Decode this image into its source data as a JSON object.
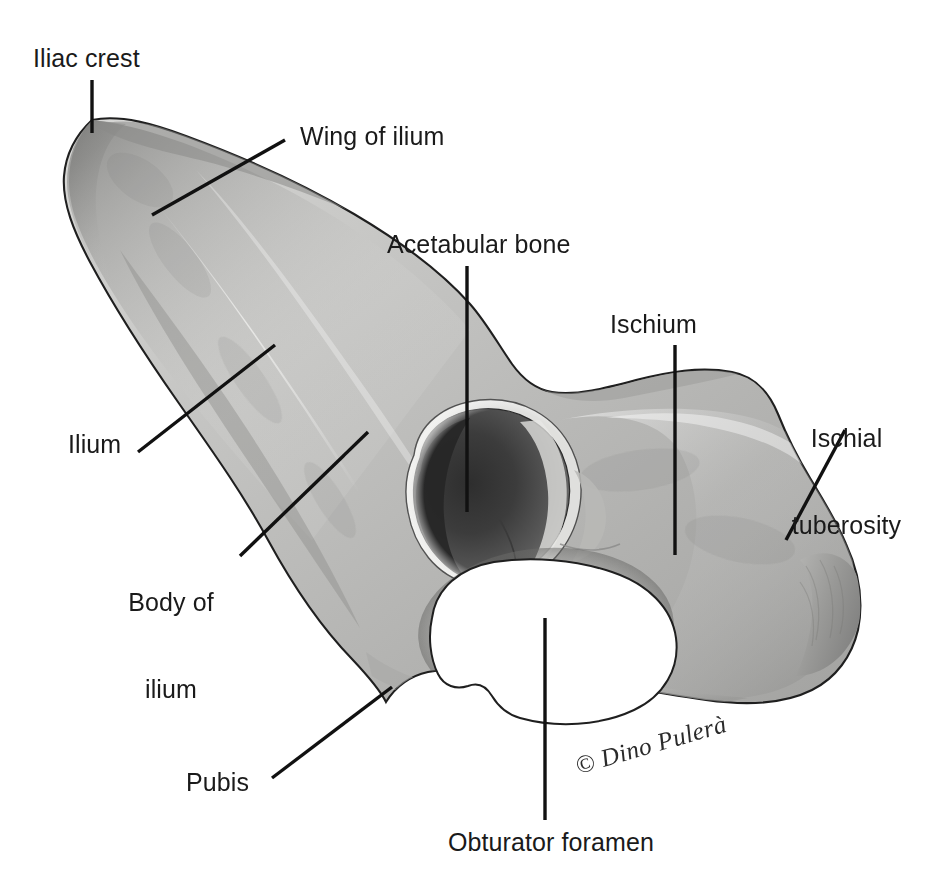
{
  "figure": {
    "background_color": "#ffffff",
    "label_color": "#1a1a1a",
    "leader_line_color": "#111111",
    "width": 939,
    "height": 883
  },
  "labels": {
    "iliac_crest": "Iliac crest",
    "wing_of_ilium": "Wing of ilium",
    "acetabular_bone": "Acetabular bone",
    "ischium": "Ischium",
    "ischial_tuberosity_line1": "Ischial",
    "ischial_tuberosity_line2": "tuberosity",
    "ilium": "Ilium",
    "body_of_ilium_line1": "Body of",
    "body_of_ilium_line2": "ilium",
    "pubis": "Pubis",
    "obturator_foramen": "Obturator foramen"
  },
  "credit": {
    "text": "© Dino Pulerà"
  },
  "anatomy": {
    "structures": [
      "Iliac crest",
      "Wing of ilium",
      "Ilium",
      "Body of ilium",
      "Acetabular bone",
      "Ischium",
      "Ischial tuberosity",
      "Pubis",
      "Obturator foramen"
    ],
    "openings": [
      "Acetabulum",
      "Obturator foramen"
    ]
  }
}
